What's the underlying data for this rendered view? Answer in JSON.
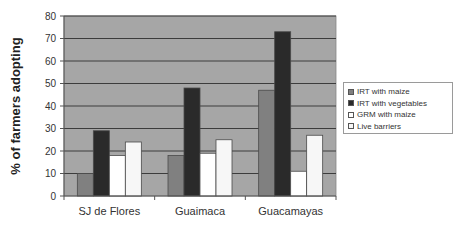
{
  "chart_data": {
    "type": "bar",
    "title": "",
    "xlabel": "",
    "ylabel": "% of farmers adopting",
    "ylim": [
      0,
      80
    ],
    "yticks": [
      0,
      10,
      20,
      30,
      40,
      50,
      60,
      70,
      80
    ],
    "grid": true,
    "legend_position": "right",
    "categories": [
      "SJ de Flores",
      "Guaimaca",
      "Guacamayas"
    ],
    "series": [
      {
        "name": "IRT with maize",
        "color": "#808080",
        "values": [
          10,
          18,
          47
        ]
      },
      {
        "name": "IRT with vegetables",
        "color": "#2a2a2a",
        "values": [
          29,
          48,
          73
        ]
      },
      {
        "name": "GRM with maize",
        "color": "#ffffff",
        "values": [
          18,
          19,
          11
        ]
      },
      {
        "name": "Live barriers",
        "color": "#f7f7f7",
        "values": [
          24,
          25,
          27
        ]
      }
    ],
    "plot_background": "#a6a6a6"
  }
}
